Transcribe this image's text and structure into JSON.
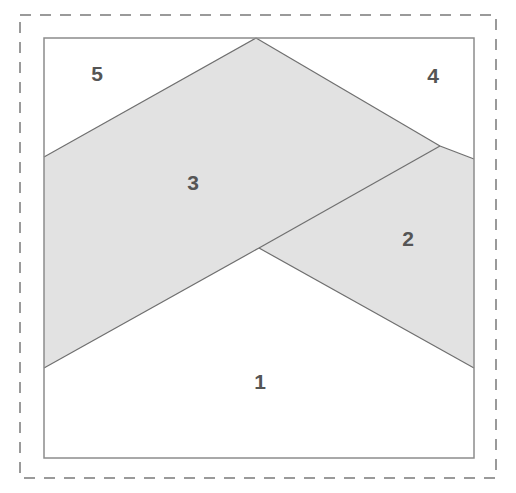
{
  "figure": {
    "canvas": {
      "width": 516,
      "height": 493,
      "background": "#ffffff"
    },
    "outer_dashed_border": {
      "name": "dashed-crop-border",
      "x": 20,
      "y": 15,
      "width": 476,
      "height": 463,
      "stroke": "#9a9a9a",
      "stroke_width": 2,
      "dash_pattern": "11 9"
    },
    "inner_frame": {
      "name": "solid-inner-frame",
      "x": 44,
      "y": 38,
      "width": 430,
      "height": 420,
      "stroke": "#8c8c8c",
      "stroke_width": 1.5,
      "fill": "#ffffff"
    },
    "colors": {
      "shaded_fill": "#e2e2e2",
      "shape_stroke": "#6f6f6f",
      "label_text": "#555555",
      "white_fill": "#ffffff",
      "page_background": "#ffffff"
    },
    "vertices": {
      "apex_top": [
        256,
        38
      ],
      "left_upper": [
        44,
        157
      ],
      "left_lower": [
        44,
        368
      ],
      "valley_center": [
        259,
        248
      ],
      "branch_right": [
        440,
        146
      ],
      "right_upper": [
        474,
        159
      ],
      "right_lower": [
        474,
        368
      ],
      "frame_top_left": [
        44,
        38
      ],
      "frame_top_right": [
        474,
        38
      ],
      "frame_bottom_left": [
        44,
        458
      ],
      "frame_bottom_right": [
        474,
        458
      ]
    },
    "regions": [
      {
        "id": "region-1",
        "label": "1",
        "shaded": false,
        "fill": "#ffffff",
        "label_pos": [
          260,
          383
        ],
        "points": "44,368 259,248 474,368 474,458 44,458"
      },
      {
        "id": "region-2",
        "label": "2",
        "shaded": true,
        "fill": "#e2e2e2",
        "label_pos": [
          408,
          240
        ],
        "points": "259,248 440,146 474,159 474,368"
      },
      {
        "id": "region-3",
        "label": "3",
        "shaded": true,
        "fill": "#e2e2e2",
        "label_pos": [
          193,
          184
        ],
        "points": "44,157 256,38 440,146 259,248 44,368"
      },
      {
        "id": "region-4",
        "label": "4",
        "shaded": false,
        "fill": "#ffffff",
        "label_pos": [
          433,
          77
        ],
        "points": "256,38 474,38 474,159 440,146"
      },
      {
        "id": "region-5",
        "label": "5",
        "shaded": false,
        "fill": "#ffffff",
        "label_pos": [
          97,
          75
        ],
        "points": "44,38 256,38 44,157"
      }
    ],
    "edges": [
      {
        "name": "edge-apex-to-left",
        "from": [
          256,
          38
        ],
        "to": [
          44,
          157
        ]
      },
      {
        "name": "edge-apex-to-branch",
        "from": [
          256,
          38
        ],
        "to": [
          440,
          146
        ]
      },
      {
        "name": "edge-branch-to-right-upper",
        "from": [
          440,
          146
        ],
        "to": [
          474,
          159
        ]
      },
      {
        "name": "edge-branch-to-valley",
        "from": [
          440,
          146
        ],
        "to": [
          259,
          248
        ]
      },
      {
        "name": "edge-valley-to-left-lower",
        "from": [
          259,
          248
        ],
        "to": [
          44,
          368
        ]
      },
      {
        "name": "edge-valley-to-right-lower",
        "from": [
          259,
          248
        ],
        "to": [
          474,
          368
        ]
      }
    ],
    "labels": [
      {
        "text": "1",
        "x": 260,
        "y": 383
      },
      {
        "text": "2",
        "x": 408,
        "y": 240
      },
      {
        "text": "3",
        "x": 193,
        "y": 184
      },
      {
        "text": "4",
        "x": 433,
        "y": 77
      },
      {
        "text": "5",
        "x": 97,
        "y": 75
      }
    ]
  }
}
